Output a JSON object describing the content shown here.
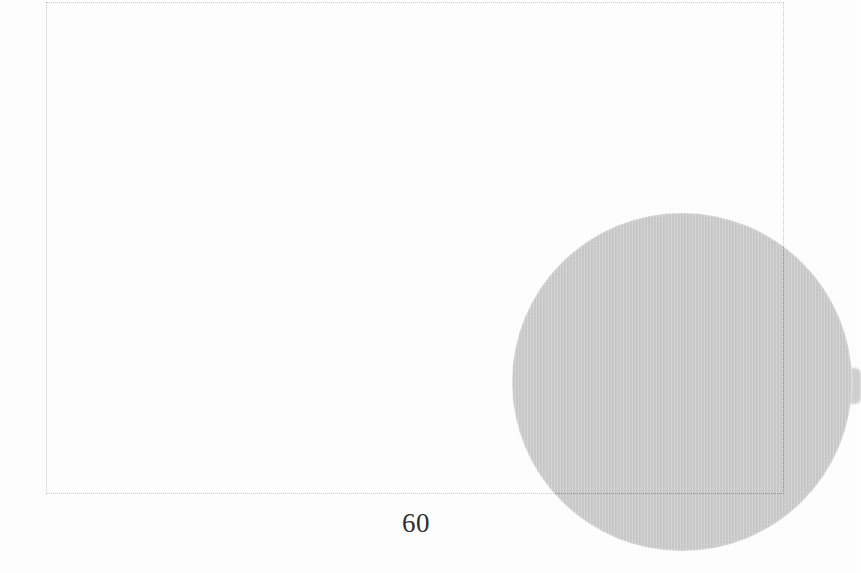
{
  "document": {
    "kind": "scanned-book-page",
    "page_number": "60",
    "background_color": "#fefefe"
  },
  "crop_frame": {
    "name": "dotted-crop-frame",
    "style": "dotted",
    "line_color_on_paper": "#c9c9c9",
    "line_color_over_object": "#8d8d8d",
    "left": 46,
    "top": 2,
    "width": 738,
    "height": 492
  },
  "object": {
    "name": "grey-lens-disc",
    "shape": "ellipse",
    "fill_color": "#c9c9c9",
    "center_x": 682,
    "center_y": 382,
    "radius_x": 170,
    "radius_y": 169,
    "stem": {
      "name": "lens-stem",
      "fill_color": "#cfcfcf",
      "left": 830,
      "top": 368,
      "width": 31,
      "height": 36
    }
  },
  "folio": {
    "label": "60",
    "left": 366,
    "top": 510,
    "width": 100
  }
}
